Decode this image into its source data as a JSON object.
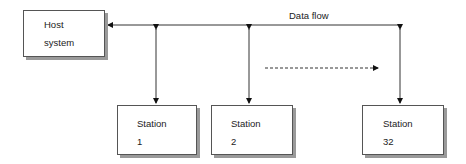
{
  "diagram": {
    "host": {
      "line1": "Host",
      "line2": "system"
    },
    "flow_label": "Data flow",
    "stations": [
      {
        "label": "Station",
        "number": "1"
      },
      {
        "label": "Station",
        "number": "2"
      },
      {
        "label": "Station",
        "number": "32"
      }
    ]
  }
}
